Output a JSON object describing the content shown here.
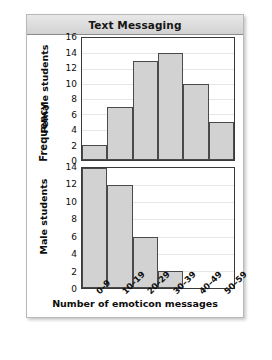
{
  "chart_data": {
    "type": "bar",
    "title": "Text Messaging",
    "xlabel": "Number of emoticon messages",
    "ylabel": "Frequency",
    "categories": [
      "0–9",
      "10–19",
      "20–29",
      "30–39",
      "40–49",
      "50–59"
    ],
    "grid": true,
    "legend": "none",
    "panels": [
      {
        "name": "Female students",
        "values": [
          2,
          7,
          13,
          14,
          10,
          5
        ],
        "ylim": [
          0,
          16
        ],
        "yticks": [
          0,
          2,
          4,
          6,
          8,
          10,
          12,
          14,
          16
        ]
      },
      {
        "name": "Male students",
        "values": [
          14,
          12,
          6,
          2,
          0,
          0
        ],
        "ylim": [
          0,
          14
        ],
        "yticks": [
          0,
          2,
          4,
          6,
          8,
          10,
          12,
          14
        ]
      }
    ],
    "colors": {
      "bar_fill": "#d2d2d2",
      "bar_edge": "#4a4a4a",
      "axis": "#3a3a3a",
      "grid": "#e6e6e6",
      "title_bar": "#dcdcdc",
      "text": "#0d0d0d"
    }
  }
}
